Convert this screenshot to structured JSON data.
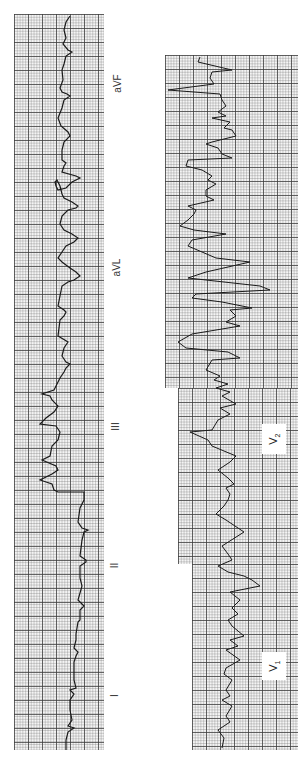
{
  "figure": {
    "type": "12-lead ECG tracing (rotated 90 degrees)",
    "paper_color": "#f4f4f4",
    "grid_color": "#3c3c3c",
    "trace_color": "#1a1a1a"
  },
  "limb_leads": {
    "labels": [
      "aVF",
      "aVL",
      "III",
      "II",
      "I"
    ]
  },
  "precordial_leads": {
    "labels": [
      {
        "lead": "V",
        "sub": "2"
      },
      {
        "lead": "V",
        "sub": "1"
      }
    ]
  }
}
